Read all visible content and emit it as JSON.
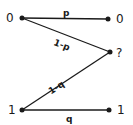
{
  "diagram": {
    "type": "binary-erasure-channel",
    "colors": {
      "ink": "#1a1a1a",
      "background": "#ffffff"
    },
    "inputs": [
      {
        "id": "in0",
        "label": "0",
        "x": 22,
        "y": 18,
        "lx": 9,
        "ly": 22
      },
      {
        "id": "in1",
        "label": "1",
        "x": 22,
        "y": 110,
        "lx": 9,
        "ly": 114
      }
    ],
    "outputs": [
      {
        "id": "out0",
        "label": "0",
        "x": 108,
        "y": 19,
        "lx": 117,
        "ly": 23
      },
      {
        "id": "outE",
        "label": "?",
        "x": 110,
        "y": 52,
        "lx": 117,
        "ly": 57
      },
      {
        "id": "out1",
        "label": "1",
        "x": 109,
        "y": 110,
        "lx": 117,
        "ly": 114
      }
    ],
    "edges": [
      {
        "from": "in0",
        "to": "out0",
        "label": "p",
        "lx": 65,
        "ly": 15
      },
      {
        "from": "in0",
        "to": "outE",
        "label": "1-p",
        "lx": 57,
        "ly": 47
      },
      {
        "from": "in1",
        "to": "outE",
        "label": "1-q",
        "lx": 48,
        "ly": 90
      },
      {
        "from": "in1",
        "to": "out1",
        "label": "q",
        "lx": 67,
        "ly": 121
      }
    ]
  }
}
